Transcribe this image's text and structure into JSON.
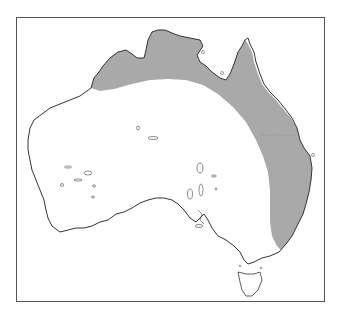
{
  "map": {
    "region": "Australia",
    "shaded_region": "northern and eastern coastal band",
    "colors": {
      "shade": "#a9a9a9",
      "coast": "#333333",
      "frame": "#555555",
      "background": "#ffffff"
    }
  }
}
